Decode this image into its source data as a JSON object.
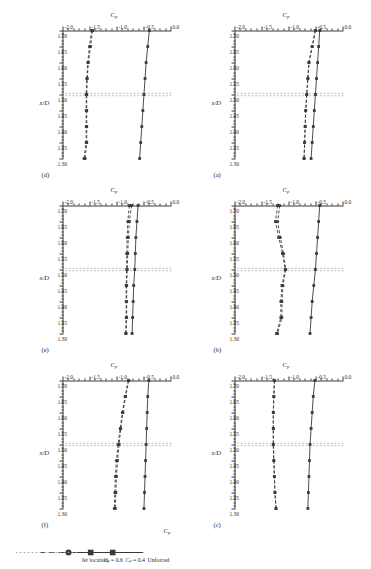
{
  "figure": {
    "type": "multi-panel-line-chart",
    "panel_count": 6,
    "rotation_deg": 90,
    "axes": {
      "xlabel": "x/D",
      "ylabel": "Cp",
      "x_ticklabels": [
        "1.70",
        "1.65",
        "1.60",
        "1.55",
        "1.50",
        "1.45",
        "1.40",
        "1.35",
        "1.30"
      ],
      "y_ticklabels": [
        "0.0",
        "-0.5",
        "-1.0",
        "-1.5",
        "-2.0"
      ],
      "xlim": [
        1.7,
        1.3
      ],
      "ylim": [
        0.0,
        -2.0
      ],
      "x_reversed": true,
      "minor_ticks_per_interval": 5
    },
    "legend": {
      "title": "Cp",
      "items": [
        {
          "label": "Unforced",
          "style": "solid",
          "marker": "square",
          "color": "#3a3a3a"
        },
        {
          "label": "Cμ = 0.4",
          "style": "dashed",
          "marker": "square",
          "color": "#3a3a3a"
        },
        {
          "label": "Cμ = 0.6",
          "style": "dashed",
          "marker": "circle",
          "color": "#3a3a3a"
        },
        {
          "label": "Jet location",
          "style": "dotted",
          "marker": "none",
          "color": "#9a9a9a"
        }
      ]
    },
    "jet_location_x": 1.5
  },
  "chart_data": {
    "type": "line",
    "title": "",
    "xlabel": "x/D",
    "ylabel": "Cp",
    "xlim": [
      1.7,
      1.3
    ],
    "ylim": [
      -2.0,
      0.0
    ],
    "grid": false,
    "legend_position": "bottom-right",
    "x": [
      1.7,
      1.65,
      1.6,
      1.55,
      1.5,
      1.45,
      1.4,
      1.35,
      1.3
    ],
    "annotations": [
      {
        "type": "vline",
        "x": 1.5,
        "label": "Jet location"
      }
    ],
    "panels": [
      {
        "label": "(a)",
        "series": [
          {
            "name": "Unforced",
            "values": [
              -0.44,
              -0.46,
              -0.48,
              -0.5,
              -0.52,
              -0.54,
              -0.56,
              -0.58,
              -0.6
            ]
          },
          {
            "name": "Cμ = 0.4",
            "values": [
              -0.52,
              -0.58,
              -0.64,
              -0.66,
              -0.68,
              -0.7,
              -0.71,
              -0.72,
              -0.73
            ]
          },
          {
            "name": "Cμ = 0.6",
            "values": [
              -0.52,
              -0.58,
              -0.64,
              -0.66,
              -0.68,
              -0.7,
              -0.71,
              -0.72,
              -0.73
            ]
          }
        ]
      },
      {
        "label": "(b)",
        "series": [
          {
            "name": "Unforced",
            "values": [
              -0.44,
              -0.46,
              -0.48,
              -0.5,
              -0.52,
              -0.55,
              -0.58,
              -0.6,
              -0.62
            ]
          },
          {
            "name": "Cμ = 0.4",
            "values": [
              -1.22,
              -1.26,
              -1.2,
              -1.13,
              -1.08,
              -1.14,
              -1.16,
              -1.16,
              -1.24
            ]
          },
          {
            "name": "Cμ = 0.6",
            "values": [
              -1.18,
              -1.22,
              -1.17,
              -1.11,
              -1.07,
              -1.12,
              -1.14,
              -1.14,
              -1.22
            ]
          }
        ]
      },
      {
        "label": "(c)",
        "series": [
          {
            "name": "Unforced",
            "values": [
              -0.53,
              -0.56,
              -0.58,
              -0.6,
              -0.62,
              -0.63,
              -0.64,
              -0.65,
              -0.66
            ]
          },
          {
            "name": "Cμ = 0.4",
            "values": [
              -1.28,
              -1.29,
              -1.3,
              -1.3,
              -1.3,
              -1.29,
              -1.28,
              -1.27,
              -1.25
            ]
          },
          {
            "name": "Cμ = 0.6",
            "values": [
              -1.28,
              -1.29,
              -1.3,
              -1.3,
              -1.3,
              -1.29,
              -1.28,
              -1.27,
              -1.25
            ]
          }
        ]
      },
      {
        "label": "(d)",
        "series": [
          {
            "name": "Unforced",
            "values": [
              -0.41,
              -0.44,
              -0.47,
              -0.49,
              -0.51,
              -0.53,
              -0.55,
              -0.57,
              -0.59
            ]
          },
          {
            "name": "Cμ = 0.4",
            "values": [
              -1.46,
              -1.5,
              -1.54,
              -1.56,
              -1.57,
              -1.57,
              -1.57,
              -1.57,
              -1.6
            ]
          },
          {
            "name": "Cμ = 0.6",
            "values": [
              -1.48,
              -1.52,
              -1.55,
              -1.57,
              -1.58,
              -1.58,
              -1.58,
              -1.58,
              -1.62
            ]
          }
        ]
      },
      {
        "label": "(e)",
        "series": [
          {
            "name": "Unforced",
            "values": [
              -0.62,
              -0.64,
              -0.66,
              -0.67,
              -0.68,
              -0.7,
              -0.71,
              -0.72,
              -0.73
            ]
          },
          {
            "name": "Cμ = 0.4",
            "values": [
              -0.74,
              -0.78,
              -0.8,
              -0.81,
              -0.82,
              -0.83,
              -0.83,
              -0.83,
              -0.84
            ]
          },
          {
            "name": "Cμ = 0.6",
            "values": [
              -0.78,
              -0.81,
              -0.82,
              -0.83,
              -0.83,
              -0.84,
              -0.84,
              -0.84,
              -0.85
            ]
          }
        ]
      },
      {
        "label": "(f)",
        "series": [
          {
            "name": "Unforced",
            "values": [
              -0.42,
              -0.44,
              -0.45,
              -0.46,
              -0.47,
              -0.48,
              -0.49,
              -0.5,
              -0.51
            ]
          },
          {
            "name": "Cμ = 0.4",
            "values": [
              -0.79,
              -0.85,
              -0.9,
              -0.94,
              -0.97,
              -1.0,
              -1.02,
              -1.03,
              -1.04
            ]
          },
          {
            "name": "Cμ = 0.6",
            "values": [
              -0.8,
              -0.86,
              -0.91,
              -0.95,
              -0.99,
              -1.02,
              -1.04,
              -1.05,
              -1.06
            ]
          }
        ]
      }
    ]
  }
}
